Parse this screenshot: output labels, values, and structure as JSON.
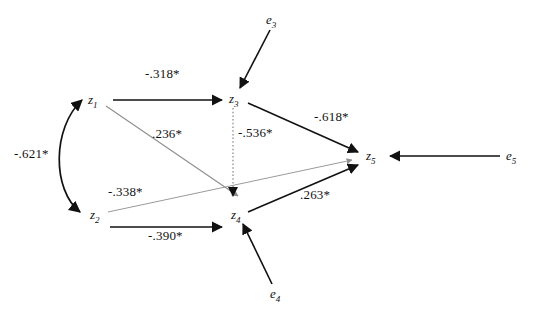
{
  "diagram": {
    "type": "path-analysis-diagram",
    "nodes": [
      {
        "id": "z1",
        "name": "z",
        "subscript": "1",
        "x": 88,
        "y": 93,
        "kind": "variable"
      },
      {
        "id": "z2",
        "name": "z",
        "subscript": "2",
        "x": 90,
        "y": 208,
        "kind": "variable"
      },
      {
        "id": "z3",
        "name": "z",
        "subscript": "3",
        "x": 229,
        "y": 92,
        "kind": "variable"
      },
      {
        "id": "z4",
        "name": "z",
        "subscript": "4",
        "x": 231,
        "y": 208,
        "kind": "variable"
      },
      {
        "id": "z5",
        "name": "z",
        "subscript": "5",
        "x": 366,
        "y": 149,
        "kind": "variable"
      },
      {
        "id": "e3",
        "name": "e",
        "subscript": "3",
        "x": 266,
        "y": 13,
        "kind": "error"
      },
      {
        "id": "e4",
        "name": "e",
        "subscript": "4",
        "x": 270,
        "y": 287,
        "kind": "error"
      },
      {
        "id": "e5",
        "name": "e",
        "subscript": "5",
        "x": 506,
        "y": 149,
        "kind": "error"
      }
    ],
    "paths": [
      {
        "id": "z1-z3",
        "from": "z1",
        "to": "z3",
        "coefficient": "-.318*",
        "style": "solid",
        "label_x": 145,
        "label_y": 67
      },
      {
        "id": "z1-z4",
        "from": "z1",
        "to": "z4",
        "coefficient": ".236*",
        "style": "faint",
        "label_x": 152,
        "label_y": 127
      },
      {
        "id": "z3-z4",
        "from": "z3",
        "to": "z4",
        "coefficient": "-.536*",
        "style": "dotted",
        "label_x": 238,
        "label_y": 126
      },
      {
        "id": "z3-z5",
        "from": "z3",
        "to": "z5",
        "coefficient": "-.618*",
        "style": "solid",
        "label_x": 314,
        "label_y": 110
      },
      {
        "id": "z2-z5",
        "from": "z2",
        "to": "z5",
        "coefficient": "-.338*",
        "style": "faint",
        "label_x": 108,
        "label_y": 185
      },
      {
        "id": "z2-z4",
        "from": "z2",
        "to": "z4",
        "coefficient": "-.390*",
        "style": "solid",
        "label_x": 148,
        "label_y": 229
      },
      {
        "id": "z4-z5",
        "from": "z4",
        "to": "z5",
        "coefficient": ".263*",
        "style": "solid",
        "label_x": 300,
        "label_y": 188
      },
      {
        "id": "z1-z2",
        "from": "z1",
        "to": "z2",
        "coefficient": "-.621*",
        "style": "curved-double",
        "label_x": 14,
        "label_y": 147
      },
      {
        "id": "e3-z3",
        "from": "e3",
        "to": "z3",
        "coefficient": "",
        "style": "solid",
        "label_x": 0,
        "label_y": 0
      },
      {
        "id": "e4-z4",
        "from": "e4",
        "to": "z4",
        "coefficient": "",
        "style": "solid",
        "label_x": 0,
        "label_y": 0
      },
      {
        "id": "e5-z5",
        "from": "e5",
        "to": "z5",
        "coefficient": "",
        "style": "solid",
        "label_x": 0,
        "label_y": 0
      }
    ]
  },
  "colors": {
    "stroke": "#111111",
    "faint_stroke": "#9a9a9a",
    "background": "#ffffff",
    "text": "#111111"
  }
}
